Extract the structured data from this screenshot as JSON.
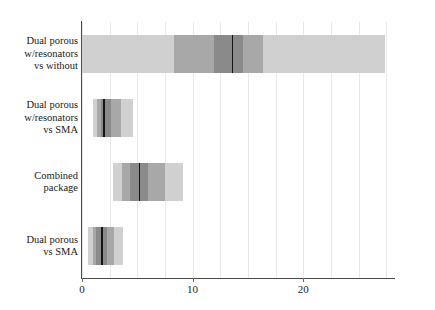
{
  "chart_data": {
    "type": "bar",
    "title": "",
    "subtitle": "",
    "xlabel": "",
    "ylabel": "",
    "orientation": "horizontal",
    "grid": true,
    "legend": false,
    "xlim": [
      0,
      28.3
    ],
    "xticks": [
      0,
      10,
      20
    ],
    "xtick_labels": [
      "0",
      "10",
      "20"
    ],
    "minor_gridlines": [
      0,
      2.5,
      5,
      7.5,
      10,
      12.5,
      15,
      17.5,
      20,
      22.5,
      25,
      27.5
    ],
    "categories": [
      "Dual porous\nw/resonators\nvs without",
      "Dual porous\nw/resonators\nvs SMA",
      "Combined\npackage",
      "Dual porous\nvs SMA"
    ],
    "series": [
      {
        "name": "outer interval",
        "shade": "#d0d0d0",
        "intervals": [
          [
            0.0,
            27.4
          ],
          [
            1.0,
            4.6
          ],
          [
            2.8,
            9.1
          ],
          [
            0.55,
            3.7
          ]
        ]
      },
      {
        "name": "mid interval",
        "shade": "#a8a8a8",
        "intervals": [
          [
            8.3,
            16.4
          ],
          [
            1.4,
            3.5
          ],
          [
            3.6,
            7.5
          ],
          [
            0.95,
            2.9
          ]
        ]
      },
      {
        "name": "inner interval",
        "shade": "#8a8a8a",
        "intervals": [
          [
            11.9,
            14.6
          ],
          [
            1.7,
            2.6
          ],
          [
            4.3,
            6.0
          ],
          [
            1.3,
            2.3
          ]
        ]
      }
    ],
    "medians": [
      13.6,
      2.0,
      5.2,
      1.8
    ],
    "median_color": "#141414",
    "background_color": "#ffffff",
    "grid_color": "#e9e9ec",
    "axis_color": "#4a4a4a",
    "text_color": "#1a1a1a"
  }
}
